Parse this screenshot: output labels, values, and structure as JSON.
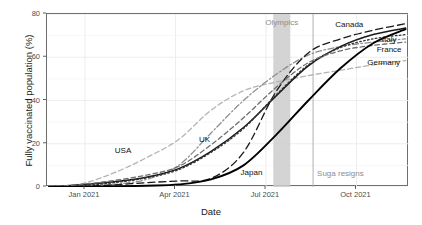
{
  "chart_data": {
    "type": "line",
    "title": "",
    "xlabel": "Date",
    "ylabel": "Fully vaccinated population (%)",
    "xlim": [
      "2020-12-01",
      "2021-11-30"
    ],
    "ylim": [
      0,
      80
    ],
    "x_tick_labels": [
      "Jan 2021",
      "Apr 2021",
      "Jul 2021",
      "Oct 2021"
    ],
    "x_tick_positions": [
      0.105,
      0.355,
      0.605,
      0.855
    ],
    "y_tick_labels": [
      "0",
      "20",
      "40",
      "60",
      "80"
    ],
    "y_tick_values": [
      0,
      20,
      40,
      60,
      80
    ],
    "grid": true,
    "legend_position": "direct-labels",
    "x_months": [
      "Dec 2020",
      "Jan 2021",
      "Feb 2021",
      "Mar 2021",
      "Apr 2021",
      "May 2021",
      "Jun 2021",
      "Jul 2021",
      "Aug 2021",
      "Sep 2021",
      "Oct 2021",
      "Nov 2021"
    ],
    "series": [
      {
        "name": "USA",
        "style": "dashed-light",
        "color": "#b4b4b4",
        "dash": "5,3",
        "values": [
          0.2,
          1.5,
          6.5,
          13.5,
          22.0,
          35.5,
          44.5,
          48.5,
          51.5,
          54.0,
          56.5,
          58.5
        ]
      },
      {
        "name": "UK",
        "style": "dot-dash",
        "color": "#8f8f8f",
        "dash": "6,2.5,1.5,2.5",
        "values": [
          0.0,
          0.4,
          1.2,
          3.5,
          10.0,
          25.0,
          40.0,
          52.0,
          61.0,
          65.0,
          67.0,
          68.5
        ]
      },
      {
        "name": "Canada",
        "style": "dashed-dark",
        "color": "#1a1a1a",
        "dash": "7,4",
        "values": [
          0.0,
          0.3,
          1.0,
          2.0,
          2.8,
          4.0,
          16.0,
          44.0,
          62.0,
          68.5,
          72.5,
          75.5
        ]
      },
      {
        "name": "Italy",
        "style": "solid",
        "color": "#1a1a1a",
        "dash": "none",
        "values": [
          0.1,
          1.0,
          2.4,
          4.5,
          8.5,
          16.5,
          27.5,
          42.0,
          56.0,
          65.0,
          70.5,
          73.5
        ]
      },
      {
        "name": "France",
        "style": "dotted",
        "color": "#333333",
        "dash": "1.6,2.4",
        "values": [
          0.0,
          0.6,
          2.0,
          4.2,
          8.0,
          16.0,
          27.0,
          42.5,
          56.5,
          64.5,
          68.5,
          70.5
        ]
      },
      {
        "name": "Germany",
        "style": "dashed-grey",
        "color": "#6e6e6e",
        "dash": "4.5,3",
        "values": [
          0.1,
          1.2,
          3.0,
          5.5,
          9.5,
          19.5,
          32.0,
          46.0,
          57.5,
          63.0,
          65.5,
          67.0
        ]
      },
      {
        "name": "Japan",
        "style": "solid-thick",
        "color": "#000000",
        "dash": "none",
        "values": [
          0.0,
          0.0,
          0.2,
          0.6,
          1.2,
          3.5,
          10.0,
          24.0,
          40.0,
          55.0,
          66.5,
          73.0
        ]
      }
    ],
    "annotations": [
      {
        "name": "Olympics",
        "label": "Olympics",
        "type": "band",
        "x_start": 0.625,
        "x_end": 0.672,
        "fill": "#cccccc"
      },
      {
        "name": "Suga resigns",
        "label": "Suga resigns",
        "type": "vline",
        "x": 0.735,
        "color": "#b0b0b0"
      }
    ],
    "direct_labels": [
      {
        "name": "USA",
        "label": "USA",
        "x": 0.21,
        "y": 0.215,
        "tone": "dark"
      },
      {
        "name": "UK",
        "label": "UK",
        "x": 0.435,
        "y": 0.275,
        "tone": "dark"
      },
      {
        "name": "Japan",
        "label": "Japan",
        "x": 0.565,
        "y": 0.085,
        "tone": "dark"
      },
      {
        "name": "Canada",
        "label": "Canada",
        "x": 0.835,
        "y": 0.945,
        "tone": "dark"
      },
      {
        "name": "Italy",
        "label": "Italy",
        "x": 0.945,
        "y": 0.855,
        "tone": "dark"
      },
      {
        "name": "France",
        "label": "France",
        "x": 0.945,
        "y": 0.795,
        "tone": "dark"
      },
      {
        "name": "Germany",
        "label": "Germany",
        "x": 0.93,
        "y": 0.725,
        "tone": "dark"
      }
    ]
  },
  "colors": {
    "panel_border": "#6e6e6e",
    "grid": "#ebebeb",
    "tick_text": "#4d4d4d",
    "axis_title": "#1a1a1a",
    "annotation_grey": "#8c8c8c",
    "olympics_band": "#cccccc",
    "suga_line": "#b0b0b0"
  }
}
